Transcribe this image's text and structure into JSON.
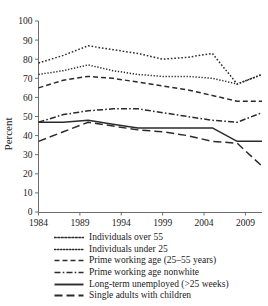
{
  "chart_data": {
    "type": "line",
    "title": "",
    "xlabel": "",
    "ylabel": "Percent",
    "ylim": [
      0,
      100
    ],
    "xlim": [
      1984,
      2011
    ],
    "grid": false,
    "legend_position": "below-plot",
    "ytick_labels": [
      "0",
      "10",
      "20",
      "30",
      "40",
      "50",
      "60",
      "70",
      "80",
      "90",
      "100"
    ],
    "ytick_values": [
      0,
      10,
      20,
      30,
      40,
      50,
      60,
      70,
      80,
      90,
      100
    ],
    "xtick_labels": [
      "1984",
      "1989",
      "1994",
      "1999",
      "2004",
      "2009"
    ],
    "xtick_values": [
      1984,
      1989,
      1994,
      1999,
      2004,
      2009
    ],
    "x": [
      1984,
      1987,
      1990,
      1993,
      1996,
      1999,
      2002,
      2005,
      2008,
      2011
    ],
    "series": [
      {
        "name": "Individuals over 55",
        "style": "dotted",
        "values": [
          78,
          82,
          87,
          85,
          83,
          80,
          81,
          83,
          67,
          72
        ]
      },
      {
        "name": "Individuals under 25",
        "style": "dotted-fine",
        "values": [
          72,
          74,
          77,
          74,
          72,
          71,
          71,
          70,
          67,
          72
        ]
      },
      {
        "name": "Prime working age (25–55 years)",
        "style": "dashed",
        "values": [
          65,
          69,
          71,
          70,
          68,
          66,
          64,
          61,
          58,
          58
        ]
      },
      {
        "name": "Prime working age nonwhite",
        "style": "dash-dot",
        "values": [
          47,
          51,
          53,
          54,
          54,
          52,
          50,
          48,
          47,
          52
        ]
      },
      {
        "name": "Long-term unemployed (>25 weeks)",
        "style": "solid",
        "values": [
          47,
          47,
          48,
          46,
          44,
          44,
          44,
          44,
          37,
          37
        ]
      },
      {
        "name": "Single adults with children",
        "style": "long-dash",
        "values": [
          37,
          42,
          47,
          45,
          43,
          42,
          40,
          37,
          36,
          24
        ]
      }
    ]
  },
  "legend": {
    "items": [
      {
        "label": "Individuals over 55",
        "style": "dotted"
      },
      {
        "label": "Individuals under 25",
        "style": "dotted-fine"
      },
      {
        "label": "Prime working age (25–55 years)",
        "style": "dashed"
      },
      {
        "label": "Prime working age nonwhite",
        "style": "dash-dot"
      },
      {
        "label": "Long-term unemployed (>25 weeks)",
        "style": "solid"
      },
      {
        "label": "Single adults with children",
        "style": "long-dash"
      }
    ]
  },
  "colors": {
    "line": "#2b2b2b",
    "axis": "#6d6d6d",
    "text": "#1a1a1a",
    "background": "#ffffff"
  }
}
